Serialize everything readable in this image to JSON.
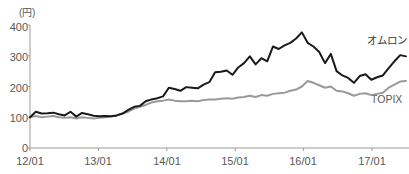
{
  "chart_data": {
    "type": "line",
    "title": "",
    "subtitle": "",
    "xlabel": "",
    "ylabel": "",
    "unit_label": "(円)",
    "grid": false,
    "legend_position": "inline-right",
    "ylim": [
      0,
      400
    ],
    "yticks": [
      0,
      100,
      200,
      300,
      400
    ],
    "ytick_labels": [
      "0",
      "100",
      "200",
      "300",
      "400"
    ],
    "xticks": [
      "12/01",
      "13/01",
      "14/01",
      "15/01",
      "16/01",
      "17/01"
    ],
    "x_range": [
      "12/01",
      "17/06"
    ],
    "series": [
      {
        "name": "オムロン",
        "color": "#1a1a1a",
        "width": 2.0,
        "x": [
          0,
          1,
          2,
          3,
          4,
          5,
          6,
          7,
          8,
          9,
          10,
          11,
          12,
          13,
          14,
          15,
          16,
          17,
          18,
          19,
          20,
          21,
          22,
          23,
          24,
          25,
          26,
          27,
          28,
          29,
          30,
          31,
          32,
          33,
          34,
          35,
          36,
          37,
          38,
          39,
          40,
          41,
          42,
          43,
          44,
          45,
          46,
          47,
          48,
          49,
          50,
          51,
          52,
          53,
          54,
          55,
          56,
          57,
          58,
          59,
          60,
          61,
          62,
          63,
          64,
          65
        ],
        "values": [
          100,
          118,
          112,
          113,
          115,
          110,
          106,
          118,
          102,
          114,
          110,
          105,
          103,
          104,
          103,
          106,
          112,
          124,
          134,
          137,
          152,
          158,
          162,
          168,
          196,
          192,
          186,
          198,
          196,
          194,
          206,
          214,
          246,
          248,
          252,
          238,
          262,
          276,
          298,
          272,
          292,
          282,
          330,
          322,
          334,
          342,
          356,
          376,
          342,
          330,
          312,
          276,
          306,
          250,
          236,
          228,
          212,
          234,
          240,
          222,
          230,
          236,
          260,
          282,
          302,
          298
        ]
      },
      {
        "name": "TOPIX",
        "color": "#9a9a96",
        "width": 2.0,
        "x": [
          0,
          1,
          2,
          3,
          4,
          5,
          6,
          7,
          8,
          9,
          10,
          11,
          12,
          13,
          14,
          15,
          16,
          17,
          18,
          19,
          20,
          21,
          22,
          23,
          24,
          25,
          26,
          27,
          28,
          29,
          30,
          31,
          32,
          33,
          34,
          35,
          36,
          37,
          38,
          39,
          40,
          41,
          42,
          43,
          44,
          45,
          46,
          47,
          48,
          49,
          50,
          51,
          52,
          53,
          54,
          55,
          56,
          57,
          58,
          59,
          60,
          61,
          62,
          63,
          64,
          65
        ],
        "values": [
          100,
          104,
          100,
          102,
          104,
          100,
          98,
          100,
          96,
          100,
          98,
          96,
          98,
          100,
          102,
          106,
          112,
          118,
          128,
          134,
          140,
          148,
          152,
          154,
          158,
          154,
          152,
          152,
          154,
          152,
          156,
          158,
          158,
          160,
          162,
          160,
          164,
          166,
          170,
          166,
          172,
          170,
          176,
          178,
          180,
          186,
          190,
          200,
          218,
          212,
          204,
          196,
          200,
          186,
          184,
          178,
          170,
          176,
          178,
          172,
          176,
          180,
          196,
          206,
          216,
          218
        ]
      }
    ]
  },
  "axis": {
    "unit": "(円)",
    "y_labels": [
      "400",
      "300",
      "200",
      "100",
      "0"
    ],
    "x_labels": [
      "12/01",
      "13/01",
      "14/01",
      "15/01",
      "16/01",
      "17/01"
    ]
  },
  "labels": {
    "omron": "オムロン",
    "topix": "TOPIX"
  },
  "colors": {
    "omron_line": "#1a1a1a",
    "topix_line": "#9a9a96",
    "axis": "#9b9b98",
    "text": "#58585a",
    "background": "#ffffff"
  }
}
